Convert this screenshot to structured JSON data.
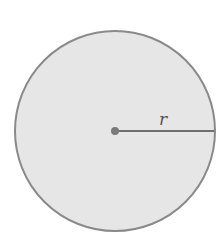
{
  "diagram": {
    "type": "circle-radius",
    "circle": {
      "cx": 115,
      "cy": 131,
      "r": 100,
      "fill": "#e6e6e6",
      "stroke": "#8a8a8a"
    },
    "center_point": {
      "x": 115,
      "y": 131
    },
    "radius_line": {
      "x1": 115,
      "y1": 131,
      "x2": 215,
      "y2": 131,
      "color": "#6f6f6f"
    },
    "radius_label": "r"
  }
}
